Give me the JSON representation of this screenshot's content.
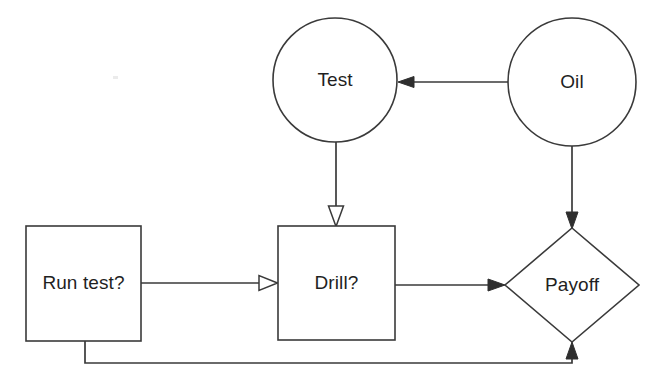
{
  "diagram": {
    "background_color": "#ffffff",
    "line_color": "#3a3a3a",
    "text_color": "#1f1f1f",
    "nodes": [
      {
        "id": "test",
        "label": "Test",
        "shape": "circle",
        "kind": "chance",
        "cx": 335,
        "cy": 80,
        "r": 62
      },
      {
        "id": "oil",
        "label": "Oil",
        "shape": "circle",
        "kind": "chance",
        "cx": 572,
        "cy": 82,
        "r": 64
      },
      {
        "id": "run-test",
        "label": "Run test?",
        "shape": "rectangle",
        "kind": "decision",
        "x": 26,
        "y": 226,
        "width": 115,
        "height": 115
      },
      {
        "id": "drill",
        "label": "Drill?",
        "shape": "rectangle",
        "kind": "decision",
        "x": 278,
        "y": 226,
        "width": 117,
        "height": 114
      },
      {
        "id": "payoff",
        "label": "Payoff",
        "shape": "diamond",
        "kind": "value",
        "cx": 572,
        "cy": 285,
        "half_width": 67,
        "half_height": 57
      }
    ],
    "edges": [
      {
        "id": "oil-to-test",
        "from": "oil",
        "to": "test",
        "direction": "left",
        "arrowhead": "solid",
        "path": "M 508 82 L 406 82"
      },
      {
        "id": "test-to-drill",
        "from": "test",
        "to": "drill",
        "direction": "down",
        "arrowhead": "hollow",
        "path": "M 336 142 L 336 209"
      },
      {
        "id": "run-test-to-drill",
        "from": "run-test",
        "to": "drill",
        "direction": "right",
        "arrowhead": "hollow",
        "path": "M 141 283 L 261 283"
      },
      {
        "id": "drill-to-payoff",
        "from": "drill",
        "to": "payoff",
        "direction": "right",
        "arrowhead": "solid",
        "path": "M 395 285 L 497 285"
      },
      {
        "id": "oil-to-payoff",
        "from": "oil",
        "to": "payoff",
        "direction": "down",
        "arrowhead": "solid",
        "path": "M 572 146 L 572 220"
      },
      {
        "id": "run-test-to-payoff",
        "from": "run-test",
        "to": "payoff",
        "direction": "up",
        "arrowhead": "solid",
        "path": "M 85 341 L 85 363 L 572 363 L 572 351"
      }
    ]
  }
}
